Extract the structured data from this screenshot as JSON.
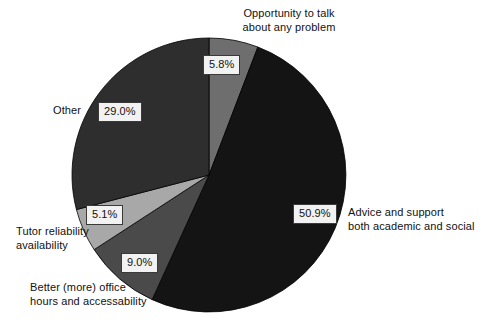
{
  "chart_data": {
    "type": "pie",
    "title": "",
    "subtitle": "",
    "xlabel": "",
    "ylabel": "",
    "legend_position": "none",
    "grid": false,
    "labels_outside": true,
    "value_label_suffix": "%",
    "categories": [
      "Opportunity to talk about any problem",
      "Advice and support both academic and social",
      "Better (more) office hours and accessability",
      "Tutor reliability availability",
      "Other"
    ],
    "values": [
      5.8,
      50.9,
      9.0,
      5.1,
      29.0
    ],
    "value_labels": [
      "5.8%",
      "50.9%",
      "9.0%",
      "5.1%",
      "29.0%"
    ],
    "colors": [
      "#6e6e6e",
      "#141414",
      "#4a4a4a",
      "#a8a8a8",
      "#2e2e2e"
    ],
    "start_angle_deg": 0,
    "direction": "clockwise",
    "slices": [
      {
        "name": "opportunity-to-talk",
        "label_line1": "Opportunity to talk",
        "label_line2": "about any problem",
        "value": 5.8,
        "value_label": "5.8%",
        "color": "#6e6e6e"
      },
      {
        "name": "advice-and-support",
        "label_line1": "Advice and support",
        "label_line2": "both academic and social",
        "value": 50.9,
        "value_label": "50.9%",
        "color": "#141414"
      },
      {
        "name": "better-office-hours",
        "label_line1": "Better (more) office",
        "label_line2": "hours and accessability",
        "value": 9.0,
        "value_label": "9.0%",
        "color": "#4a4a4a"
      },
      {
        "name": "tutor-reliability",
        "label_line1": "Tutor reliability",
        "label_line2": "availability",
        "value": 5.1,
        "value_label": "5.1%",
        "color": "#a8a8a8"
      },
      {
        "name": "other",
        "label_line1": "Other",
        "label_line2": "",
        "value": 29.0,
        "value_label": "29.0%",
        "color": "#2e2e2e"
      }
    ]
  },
  "geometry": {
    "center_x": 209,
    "center_y": 175,
    "radius": 137
  }
}
